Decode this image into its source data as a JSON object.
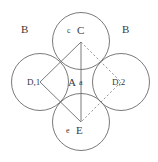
{
  "figure": {
    "background_color": "#ffffff",
    "stroke_color": "#6b6b6b",
    "text_color": "#3a3a3a",
    "width": 158,
    "height": 162
  },
  "labels": {
    "region_b_left": "B",
    "region_b_right": "B",
    "top_small": "c",
    "top_capital": "C",
    "center_capital": "A",
    "center_small": "a",
    "left_node": "D,1",
    "right_node": "D,2",
    "bottom_small": "e",
    "bottom_capital": "E"
  },
  "geometry": {
    "circles": [
      {
        "name": "top-circle",
        "cx": 81,
        "cy": 41,
        "r": 28.5
      },
      {
        "name": "left-circle",
        "cx": 40,
        "cy": 82,
        "r": 28.5
      },
      {
        "name": "right-circle",
        "cx": 121,
        "cy": 82,
        "r": 28.5
      },
      {
        "name": "bottom-circle",
        "cx": 81,
        "cy": 122,
        "r": 28.5
      }
    ],
    "rhombus_points": {
      "top": [
        81,
        42
      ],
      "left": [
        40,
        82
      ],
      "bottom": [
        81,
        122
      ],
      "right": [
        121,
        82
      ]
    },
    "solid_edges": [
      {
        "name": "edge-top-left",
        "from": [
          81,
          42
        ],
        "to": [
          40,
          82
        ]
      },
      {
        "name": "edge-left-bottom",
        "from": [
          40,
          82
        ],
        "to": [
          81,
          122
        ]
      }
    ],
    "dashed_edges": [
      {
        "name": "edge-top-right",
        "from": [
          81,
          42
        ],
        "to": [
          121,
          82
        ]
      },
      {
        "name": "edge-right-bottom",
        "from": [
          121,
          82
        ],
        "to": [
          81,
          122
        ]
      }
    ],
    "axis_line": {
      "name": "vertical-axis",
      "from": [
        81,
        42
      ],
      "to": [
        81,
        122
      ]
    }
  }
}
